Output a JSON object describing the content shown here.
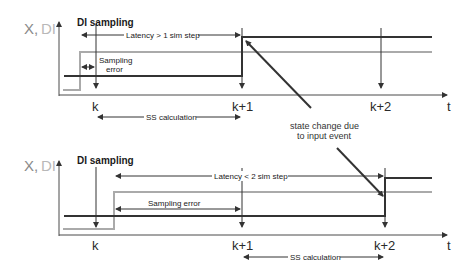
{
  "colors": {
    "axis": "#4a4a4a",
    "x_signal": "#333333",
    "di_signal": "#aaaaaa",
    "text": "#1a1a1a",
    "axis_label": "#8a8a8a"
  },
  "top_panel": {
    "y_axis_label_x": "X,",
    "y_axis_label_di": "DI",
    "di_sampling_label": "DI sampling",
    "latency_label": "Latency > 1 sim step",
    "sampling_error_label_1": "Sampling",
    "sampling_error_label_2": "error",
    "ss_calc_label": "SS calculation",
    "ticks": [
      "k",
      "k+1",
      "k+2"
    ],
    "t_label": "t"
  },
  "bottom_panel": {
    "y_axis_label_x": "X,",
    "y_axis_label_di": "DI",
    "di_sampling_label": "DI sampling",
    "latency_label": "Latency < 2 sim step",
    "sampling_error_label": "Sampling error",
    "ss_calc_label": "SS calculation",
    "ticks": [
      "k",
      "k+1",
      "k+2"
    ],
    "t_label": "t"
  },
  "annotation": {
    "line1": "state change due",
    "line2": "to input event"
  }
}
